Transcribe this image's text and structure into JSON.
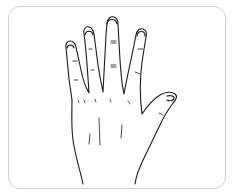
{
  "illustration": {
    "subject": "hand-palm-line-drawing",
    "caption": "Open hand illustration",
    "stroke_color": "#1a1a1a",
    "frame_border_color": "#cfcfcf",
    "background_color": "#ffffff"
  }
}
